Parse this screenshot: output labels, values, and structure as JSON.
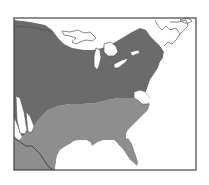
{
  "map": {
    "description": "Range map of eastern United States with two shaded zones",
    "colors": {
      "background": "#ffffff",
      "frame": "#444444",
      "northern_zone": "#6b6b6b",
      "southern_zone": "#8e8e8e",
      "outline": "#555555",
      "water": "#ffffff"
    },
    "regions": [
      {
        "name": "northern-zone",
        "shade": "dark"
      },
      {
        "name": "southern-zone",
        "shade": "light"
      }
    ]
  }
}
